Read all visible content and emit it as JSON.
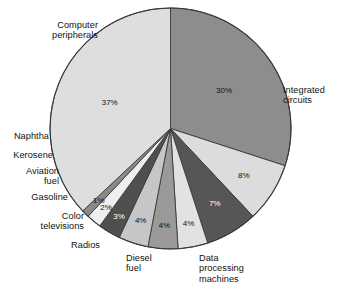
{
  "chart_data": {
    "type": "pie",
    "title": "",
    "subtitle": "",
    "xlabel": "",
    "ylabel": "",
    "legend_position": "callout-labels",
    "grid": false,
    "units": "percent",
    "start_angle_deg": 0,
    "direction": "clockwise",
    "categories": [
      "Integrated circuits",
      "Data processing machines",
      "Diesel fuel",
      "Radios",
      "Color televisions",
      "Gasoline",
      "Aviation fuel",
      "Kerosene",
      "Naphtha",
      "Computer peripherals"
    ],
    "values": [
      30,
      8,
      7,
      4,
      4,
      4,
      3,
      2,
      1,
      37
    ],
    "value_labels": [
      "30%",
      "8%",
      "7%",
      "4%",
      "4%",
      "4%",
      "3%",
      "2%",
      "1%",
      "37%"
    ],
    "slice_colors": [
      "#8d8d8d",
      "#dcdcdc",
      "#565656",
      "#e2e2e2",
      "#9a9a9a",
      "#c6c6c6",
      "#4f4f4f",
      "#efefef",
      "#8a8a8a",
      "#dedede"
    ],
    "label_text_color": "#111111",
    "stroke_color": "#3a3a3a"
  },
  "slices": [
    {
      "name": "integrated-circuits",
      "label": "Integrated\ncircuits",
      "pct": "30%"
    },
    {
      "name": "data-processing-machines",
      "label": "Data\nprocessing\nmachines",
      "pct": "8%"
    },
    {
      "name": "diesel-fuel",
      "label": "Diesel\nfuel",
      "pct": "7%"
    },
    {
      "name": "radios",
      "label": "Radios",
      "pct": "4%"
    },
    {
      "name": "color-televisions",
      "label": "Color\ntelevisions",
      "pct": "4%"
    },
    {
      "name": "gasoline",
      "label": "Gasoline",
      "pct": "4%"
    },
    {
      "name": "aviation-fuel",
      "label": "Aviation\nfuel",
      "pct": "3%"
    },
    {
      "name": "kerosene",
      "label": "Kerosene",
      "pct": "2%"
    },
    {
      "name": "naphtha",
      "label": "Naphtha",
      "pct": "1%"
    },
    {
      "name": "computer-peripherals",
      "label": "Computer\nperipherals",
      "pct": "37%"
    }
  ]
}
